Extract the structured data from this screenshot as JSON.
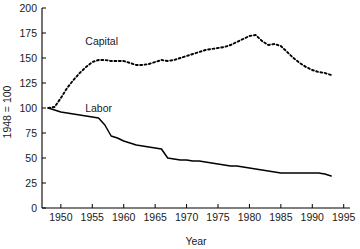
{
  "chart_data": {
    "type": "line",
    "title": "",
    "xlabel": "Year",
    "ylabel": "1948 = 100",
    "xlim": [
      1947,
      1996
    ],
    "ylim": [
      0,
      200
    ],
    "grid": false,
    "legend_position": "inline-annotation",
    "xticks": [
      1950,
      1955,
      1960,
      1965,
      1970,
      1975,
      1980,
      1985,
      1990,
      1995
    ],
    "yticks": [
      0,
      25,
      50,
      75,
      100,
      125,
      150,
      175,
      200
    ],
    "xticklabels": [
      "1950",
      "1955",
      "1960",
      "1965",
      "1970",
      "1975",
      "1980",
      "1985",
      "1990",
      "1995"
    ],
    "yticklabels": [
      "0",
      "25",
      "50",
      "75",
      "100",
      "125",
      "150",
      "175",
      "200"
    ],
    "annotations": [
      {
        "text": "Capital",
        "x": 1956.5,
        "y": 163
      },
      {
        "text": "Labor",
        "x": 1956.0,
        "y": 96
      }
    ],
    "series": [
      {
        "name": "Capital",
        "style": "dotted",
        "color": "#000000",
        "x": [
          1948,
          1949,
          1950,
          1951,
          1952,
          1953,
          1954,
          1955,
          1956,
          1957,
          1958,
          1959,
          1960,
          1961,
          1962,
          1963,
          1964,
          1965,
          1966,
          1967,
          1968,
          1969,
          1970,
          1971,
          1972,
          1973,
          1974,
          1975,
          1976,
          1977,
          1978,
          1979,
          1980,
          1981,
          1982,
          1983,
          1984,
          1985,
          1986,
          1987,
          1988,
          1989,
          1990,
          1991,
          1992,
          1993
        ],
        "values": [
          100,
          101,
          110,
          120,
          128,
          135,
          141,
          146,
          148,
          148,
          147,
          147,
          147,
          145,
          143,
          143,
          144,
          146,
          148,
          147,
          148,
          150,
          152,
          154,
          156,
          158,
          159,
          160,
          161,
          163,
          166,
          169,
          172,
          173,
          167,
          163,
          164,
          162,
          156,
          150,
          145,
          141,
          138,
          136,
          135,
          133
        ]
      },
      {
        "name": "Labor",
        "style": "solid",
        "color": "#000000",
        "x": [
          1948,
          1949,
          1950,
          1951,
          1952,
          1953,
          1954,
          1955,
          1956,
          1957,
          1958,
          1959,
          1960,
          1961,
          1962,
          1963,
          1964,
          1965,
          1966,
          1967,
          1968,
          1969,
          1970,
          1971,
          1972,
          1973,
          1974,
          1975,
          1976,
          1977,
          1978,
          1979,
          1980,
          1981,
          1982,
          1983,
          1984,
          1985,
          1986,
          1987,
          1988,
          1989,
          1990,
          1991,
          1992,
          1993
        ],
        "values": [
          100,
          98,
          96,
          95,
          94,
          93,
          92,
          91,
          90,
          83,
          72,
          70,
          67,
          65,
          63,
          62,
          61,
          60,
          59,
          50,
          49,
          48,
          48,
          47,
          47,
          46,
          45,
          44,
          43,
          42,
          42,
          41,
          40,
          39,
          38,
          37,
          36,
          35,
          35,
          35,
          35,
          35,
          35,
          35,
          34,
          32
        ]
      }
    ]
  }
}
